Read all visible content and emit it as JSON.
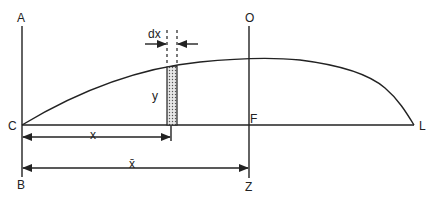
{
  "diagram": {
    "type": "area-centroid-figure",
    "colors": {
      "stroke": "#222222",
      "background": "#ffffff",
      "strip_fill": "#d8d8d8"
    },
    "points": {
      "A": "A",
      "B": "B",
      "C": "C",
      "O": "O",
      "Z": "Z",
      "F": "F",
      "L": "L"
    },
    "strip_labels": {
      "width": "dx",
      "height": "y"
    },
    "dimensions": {
      "x": "x",
      "x_bar": "x̄"
    }
  }
}
